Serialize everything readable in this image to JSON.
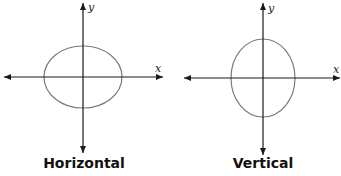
{
  "diagrams": [
    {
      "caption": "Horizontal",
      "x_axis_label": "x",
      "y_axis_label": "y",
      "ellipse": {
        "orientation": "horizontal",
        "major_axis": "x"
      }
    },
    {
      "caption": "Vertical",
      "x_axis_label": "x",
      "y_axis_label": "y",
      "ellipse": {
        "orientation": "vertical",
        "major_axis": "y"
      }
    }
  ],
  "colors": {
    "axis": "#1a1a1a",
    "ellipse": "#7a7a7a"
  }
}
